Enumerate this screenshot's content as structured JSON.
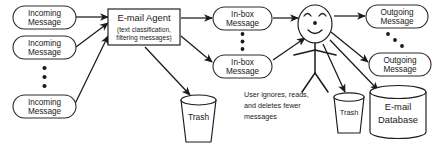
{
  "diagram": {
    "colors": {
      "stroke": "#1a1a1a",
      "background": "#ffffff",
      "text": "#1a1a1a"
    },
    "incoming": {
      "first": {
        "line1": "Incoming",
        "line2": "Message"
      },
      "second": {
        "line1": "Incoming",
        "line2": "Message"
      },
      "last": {
        "line1": "Incoming",
        "line2": "Message"
      },
      "ellipsis": "• • •"
    },
    "agent": {
      "title": "E-mail Agent",
      "subtitle_line1": "(text classification,",
      "subtitle_line2": "filtering messages)"
    },
    "inbox": {
      "first": {
        "line1": "In-box",
        "line2": "Message"
      },
      "last": {
        "line1": "In-box",
        "line2": "Message"
      },
      "ellipsis": "• • •"
    },
    "user": {
      "note_line1": "User ignores, reads,",
      "note_line2": "and deletes fewer",
      "note_line3": "messages",
      "face": "smiling-face"
    },
    "outgoing": {
      "first": {
        "line1": "Outgoing",
        "line2": "Message"
      },
      "last": {
        "line1": "Outgoing",
        "line2": "Message"
      },
      "ellipsis": "• • •"
    },
    "trash_agent": {
      "label": "Trash"
    },
    "trash_user": {
      "label": "Trash"
    },
    "database": {
      "line1": "E-mail",
      "line2": "Database"
    }
  }
}
